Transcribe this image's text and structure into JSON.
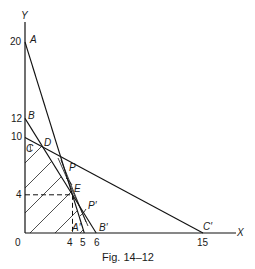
{
  "figure": {
    "caption": "Fig. 14–12",
    "axes": {
      "x_label": "X",
      "y_label": "Y",
      "origin_label": "0",
      "x_ticks": [
        "4",
        "5",
        "6",
        "15"
      ],
      "y_ticks": [
        "20",
        "12",
        "10",
        "4"
      ]
    },
    "points": {
      "A": "A",
      "A_prime": "A′",
      "B": "B",
      "B_prime": "B′",
      "C": "C",
      "C_prime": "C′",
      "D": "D",
      "E": "E",
      "P": "P",
      "P_prime": "P′"
    },
    "lines": [
      {
        "name": "AA'",
        "from": [
          0,
          20
        ],
        "to": [
          5,
          0
        ]
      },
      {
        "name": "BB'",
        "from": [
          0,
          12
        ],
        "to": [
          6,
          0
        ]
      },
      {
        "name": "CC'",
        "from": [
          0,
          10
        ],
        "to": [
          15,
          0
        ]
      },
      {
        "name": "PP'",
        "through": [
          4,
          4
        ]
      }
    ],
    "feasible_region": [
      [
        0,
        0
      ],
      [
        0,
        10
      ],
      [
        1.5,
        9
      ],
      [
        4,
        4
      ],
      [
        5,
        0
      ]
    ],
    "optimum": {
      "label": "E",
      "x": 4,
      "y": 4
    }
  }
}
